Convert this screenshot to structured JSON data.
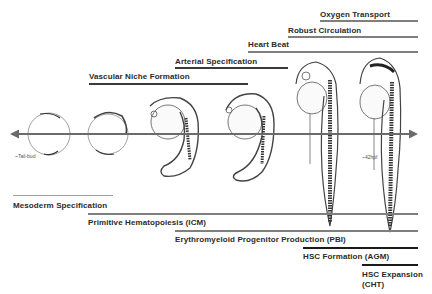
{
  "diagram": {
    "type": "developmental-timeline",
    "arrow": {
      "direction": "bidirectional",
      "color": "#6b6b6b"
    },
    "time_markers": {
      "start": "~Tail-bud",
      "end": "~42hpf"
    },
    "stages_illustrated": [
      "tail-bud embryo",
      "early somite embryo",
      "mid-somite embryo",
      "late somite embryo",
      "prim stage embryo",
      "long-pec larva"
    ],
    "vascular_events": [
      {
        "label": "Oxygen Transport",
        "bar_color": "#808080"
      },
      {
        "label": "Robust Circulation",
        "bar_color": "#808080"
      },
      {
        "label": "Heart Beat",
        "bar_color": "#808080"
      },
      {
        "label": "Arterial Specification",
        "bar_color": "#3a3a3a"
      },
      {
        "label": "Vascular Niche Formation",
        "bar_color": "#3a3a3a"
      }
    ],
    "hematopoietic_events": [
      {
        "label": "Mesoderm Specification",
        "bar_color": "#a0a0a0"
      },
      {
        "label": "Primitive Hematopoiesis (ICM)",
        "bar_color": "#808080"
      },
      {
        "label": "Erythromyeloid Progenitor Production (PBI)",
        "bar_color": "#808080"
      },
      {
        "label": "HSC Formation (AGM)",
        "bar_color": "#1a1a1a"
      },
      {
        "label_line1": "HSC Expansion",
        "label_line2": "(CHT)",
        "bar_color": "#1a1a1a"
      }
    ]
  }
}
